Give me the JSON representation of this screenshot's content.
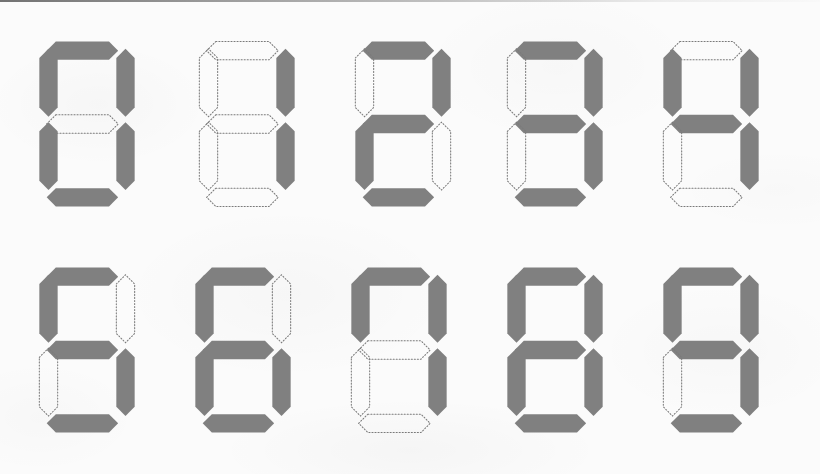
{
  "sheet": {
    "title": "Seven Segment Digits 0-9",
    "description": "A 5 by 2 grid of seven-segment display glyphs showing the digits 0 through 9 in order. Lit segments are filled solid gray; unlit segments are drawn as dotted hexagonal outlines.",
    "background_color": "#fbfbfb",
    "segment_on_color": "#808080",
    "segment_off_stroke_color": "#7a7a7a",
    "top_edge_line_color": "#5a5a5a",
    "columns": 5,
    "rows": 2,
    "width": 820,
    "height": 474
  },
  "segment_order": [
    "top",
    "top-left",
    "top-right",
    "middle",
    "bottom-left",
    "bottom-right",
    "bottom"
  ],
  "digits": [
    {
      "value": "0",
      "name": "digit-zero",
      "row": 0,
      "column": 0,
      "x": 32,
      "y": 26,
      "segments": {
        "top": true,
        "top-left": true,
        "top-right": true,
        "middle": false,
        "bottom-left": true,
        "bottom-right": true,
        "bottom": true
      },
      "lit_count": 6
    },
    {
      "value": "1",
      "name": "digit-one",
      "row": 0,
      "column": 1,
      "x": 192,
      "y": 26,
      "segments": {
        "top": false,
        "top-left": false,
        "top-right": true,
        "middle": false,
        "bottom-left": false,
        "bottom-right": true,
        "bottom": false
      },
      "lit_count": 2
    },
    {
      "value": "2",
      "name": "digit-two",
      "row": 0,
      "column": 2,
      "x": 348,
      "y": 26,
      "segments": {
        "top": true,
        "top-left": false,
        "top-right": true,
        "middle": true,
        "bottom-left": true,
        "bottom-right": false,
        "bottom": true
      },
      "lit_count": 5
    },
    {
      "value": "3",
      "name": "digit-three",
      "row": 0,
      "column": 3,
      "x": 500,
      "y": 26,
      "segments": {
        "top": true,
        "top-left": false,
        "top-right": true,
        "middle": true,
        "bottom-left": false,
        "bottom-right": true,
        "bottom": true
      },
      "lit_count": 5
    },
    {
      "value": "4",
      "name": "digit-four",
      "row": 0,
      "column": 4,
      "x": 656,
      "y": 26,
      "segments": {
        "top": false,
        "top-left": true,
        "top-right": true,
        "middle": true,
        "bottom-left": false,
        "bottom-right": true,
        "bottom": false
      },
      "lit_count": 4
    },
    {
      "value": "5",
      "name": "digit-five",
      "row": 1,
      "column": 0,
      "x": 32,
      "y": 252,
      "segments": {
        "top": true,
        "top-left": true,
        "top-right": false,
        "middle": true,
        "bottom-left": false,
        "bottom-right": true,
        "bottom": true
      },
      "lit_count": 5
    },
    {
      "value": "6",
      "name": "digit-six",
      "row": 1,
      "column": 1,
      "x": 188,
      "y": 252,
      "segments": {
        "top": true,
        "top-left": true,
        "top-right": false,
        "middle": true,
        "bottom-left": true,
        "bottom-right": true,
        "bottom": true
      },
      "lit_count": 6
    },
    {
      "value": "7",
      "name": "digit-seven",
      "row": 1,
      "column": 2,
      "x": 344,
      "y": 252,
      "segments": {
        "top": true,
        "top-left": true,
        "top-right": true,
        "middle": false,
        "bottom-left": false,
        "bottom-right": true,
        "bottom": false
      },
      "lit_count": 4
    },
    {
      "value": "8",
      "name": "digit-eight",
      "row": 1,
      "column": 3,
      "x": 500,
      "y": 252,
      "segments": {
        "top": true,
        "top-left": true,
        "top-right": true,
        "middle": true,
        "bottom-left": true,
        "bottom-right": true,
        "bottom": true
      },
      "lit_count": 7
    },
    {
      "value": "9",
      "name": "digit-nine",
      "row": 1,
      "column": 4,
      "x": 656,
      "y": 252,
      "segments": {
        "top": true,
        "top-left": true,
        "top-right": true,
        "middle": true,
        "bottom-left": false,
        "bottom-right": true,
        "bottom": true
      },
      "lit_count": 6
    }
  ],
  "segment_geometry": {
    "horizontal_top": "26,8 84,8 94,18 84,28 26,28 16,18",
    "horizontal_middle": "26,88 84,88 94,98 84,108 26,108 16,98",
    "horizontal_bottom": "26,168 84,168 94,178 84,188 26,188 16,178",
    "vertical_upper_left": "8,26 18,16 28,26 28,80 18,90 8,80",
    "vertical_upper_right": "92,26 102,16 112,26 112,80 102,90 92,80",
    "vertical_lower_left": "8,106 18,96 28,106 28,160 18,170 8,160",
    "vertical_lower_right": "92,106 102,96 112,106 112,160 102,170 92,160"
  }
}
